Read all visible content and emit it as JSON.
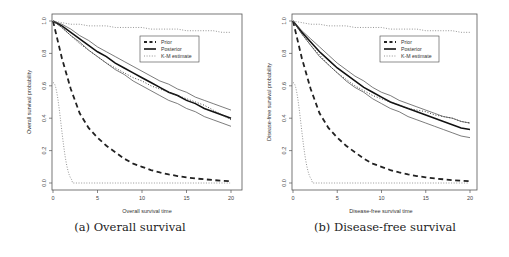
{
  "figure": {
    "subfigures": [
      {
        "id": "a",
        "caption": "(a) Overall survival"
      },
      {
        "id": "b",
        "caption": "(b) Disease-free survival"
      }
    ]
  },
  "chart_data": [
    {
      "type": "line",
      "title": "",
      "xlabel": "Overall survival time",
      "ylabel": "Overall survival probability",
      "xlim": [
        0,
        20
      ],
      "ylim": [
        0,
        1
      ],
      "xticks": [
        "0",
        "5",
        "10",
        "15",
        "20"
      ],
      "yticks": [
        "0.0",
        "0.2",
        "0.4",
        "0.6",
        "0.8",
        "1.0"
      ],
      "grid": false,
      "legend": {
        "position": "upper right (inset)",
        "entries": [
          "Prior",
          "Posterior",
          "K-M estimate"
        ]
      },
      "x": [
        0,
        1,
        2,
        3,
        4,
        5,
        6,
        7,
        8,
        9,
        10,
        11,
        12,
        13,
        14,
        15,
        16,
        17,
        18,
        19,
        20
      ],
      "series": [
        {
          "name": "Prior",
          "style": "dashed",
          "values": [
            1.0,
            0.77,
            0.58,
            0.43,
            0.34,
            0.28,
            0.23,
            0.19,
            0.15,
            0.12,
            0.1,
            0.08,
            0.065,
            0.053,
            0.043,
            0.035,
            0.028,
            0.023,
            0.018,
            0.014,
            0.011
          ]
        },
        {
          "name": "Prior (fast-decay dotted)",
          "style": "dotted-grey",
          "values": [
            0.62,
            0.3,
            0.01,
            0,
            0,
            0,
            0,
            0,
            0,
            0,
            0,
            0,
            0,
            0,
            0,
            0,
            0,
            0,
            0,
            0,
            0
          ]
        },
        {
          "name": "Posterior",
          "style": "solid-thick",
          "values": [
            1.0,
            0.97,
            0.93,
            0.89,
            0.85,
            0.81,
            0.78,
            0.74,
            0.71,
            0.68,
            0.65,
            0.62,
            0.59,
            0.56,
            0.54,
            0.51,
            0.49,
            0.46,
            0.44,
            0.42,
            0.4
          ]
        },
        {
          "name": "Posterior upper",
          "style": "solid-thin",
          "values": [
            1.0,
            0.98,
            0.95,
            0.91,
            0.88,
            0.84,
            0.81,
            0.78,
            0.75,
            0.72,
            0.69,
            0.66,
            0.63,
            0.61,
            0.58,
            0.56,
            0.53,
            0.51,
            0.49,
            0.47,
            0.45
          ]
        },
        {
          "name": "Posterior lower",
          "style": "solid-thin",
          "values": [
            1.0,
            0.96,
            0.91,
            0.87,
            0.82,
            0.78,
            0.74,
            0.7,
            0.67,
            0.63,
            0.6,
            0.57,
            0.54,
            0.51,
            0.49,
            0.46,
            0.44,
            0.41,
            0.39,
            0.37,
            0.35
          ]
        },
        {
          "name": "K-M estimate",
          "style": "dotted",
          "values": [
            1.0,
            0.96,
            0.91,
            0.86,
            0.82,
            0.78,
            0.74,
            0.71,
            0.68,
            0.65,
            0.63,
            0.6,
            0.58,
            0.56,
            0.54,
            0.52,
            0.5,
            0.48,
            0.45,
            0.42,
            0.39
          ]
        },
        {
          "name": "K-M upper (flat dotted)",
          "style": "dotted-grey",
          "values": [
            1.0,
            0.99,
            0.98,
            0.98,
            0.97,
            0.97,
            0.97,
            0.96,
            0.96,
            0.96,
            0.96,
            0.95,
            0.95,
            0.95,
            0.95,
            0.94,
            0.94,
            0.94,
            0.94,
            0.93,
            0.93
          ]
        }
      ]
    },
    {
      "type": "line",
      "title": "",
      "xlabel": "Disease-free survival time",
      "ylabel": "Disease-free survival probability",
      "xlim": [
        0,
        20
      ],
      "ylim": [
        0,
        1
      ],
      "xticks": [
        "0",
        "5",
        "10",
        "15",
        "20"
      ],
      "yticks": [
        "0.0",
        "0.2",
        "0.4",
        "0.6",
        "0.8",
        "1.0"
      ],
      "grid": false,
      "legend": {
        "position": "upper right (inset)",
        "entries": [
          "Prior",
          "Posterior",
          "K-M estimate"
        ]
      },
      "x": [
        0,
        1,
        2,
        3,
        4,
        5,
        6,
        7,
        8,
        9,
        10,
        11,
        12,
        13,
        14,
        15,
        16,
        17,
        18,
        19,
        20
      ],
      "series": [
        {
          "name": "Prior",
          "style": "dashed",
          "values": [
            1.0,
            0.77,
            0.58,
            0.43,
            0.34,
            0.28,
            0.23,
            0.19,
            0.15,
            0.12,
            0.1,
            0.08,
            0.065,
            0.053,
            0.043,
            0.035,
            0.028,
            0.023,
            0.018,
            0.014,
            0.011
          ]
        },
        {
          "name": "Prior (fast-decay dotted)",
          "style": "dotted-grey",
          "values": [
            0.62,
            0.3,
            0.01,
            0,
            0,
            0,
            0,
            0,
            0,
            0,
            0,
            0,
            0,
            0,
            0,
            0,
            0,
            0,
            0,
            0,
            0
          ]
        },
        {
          "name": "Posterior",
          "style": "solid-thick",
          "values": [
            1.0,
            0.93,
            0.87,
            0.81,
            0.76,
            0.71,
            0.67,
            0.63,
            0.59,
            0.56,
            0.53,
            0.5,
            0.48,
            0.46,
            0.44,
            0.42,
            0.4,
            0.38,
            0.36,
            0.34,
            0.33
          ]
        },
        {
          "name": "Posterior upper",
          "style": "solid-thin",
          "values": [
            1.0,
            0.94,
            0.89,
            0.84,
            0.79,
            0.74,
            0.7,
            0.66,
            0.63,
            0.59,
            0.56,
            0.54,
            0.51,
            0.49,
            0.47,
            0.45,
            0.43,
            0.41,
            0.4,
            0.38,
            0.37
          ]
        },
        {
          "name": "Posterior lower",
          "style": "solid-thin",
          "values": [
            1.0,
            0.92,
            0.85,
            0.78,
            0.73,
            0.68,
            0.63,
            0.59,
            0.56,
            0.52,
            0.49,
            0.46,
            0.44,
            0.41,
            0.39,
            0.37,
            0.35,
            0.33,
            0.31,
            0.29,
            0.28
          ]
        },
        {
          "name": "K-M estimate",
          "style": "dotted",
          "values": [
            1.0,
            0.92,
            0.85,
            0.79,
            0.73,
            0.68,
            0.64,
            0.6,
            0.57,
            0.54,
            0.52,
            0.5,
            0.48,
            0.46,
            0.45,
            0.44,
            0.42,
            0.41,
            0.4,
            0.38,
            0.37
          ]
        },
        {
          "name": "K-M upper (flat dotted)",
          "style": "dotted-grey",
          "values": [
            1.0,
            0.99,
            0.98,
            0.98,
            0.97,
            0.97,
            0.97,
            0.96,
            0.96,
            0.96,
            0.96,
            0.95,
            0.95,
            0.95,
            0.95,
            0.94,
            0.94,
            0.94,
            0.94,
            0.93,
            0.93
          ]
        }
      ]
    }
  ]
}
